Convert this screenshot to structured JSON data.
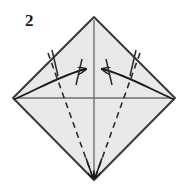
{
  "figure": {
    "type": "origami-diagram",
    "step_label": "2",
    "colors": {
      "paper_fill": "#e9e9e9",
      "paper_outline": "#3a3a3a",
      "crease_line": "#6e6e6e",
      "fold_dashed": "#2b2b2b",
      "arrow": "#1a1a1a",
      "background": "#ffffff",
      "label_text": "#1a1a1a"
    },
    "shape": {
      "name": "diamond",
      "vertices": {
        "top": [
          94,
          17
        ],
        "right": [
          175,
          98
        ],
        "bottom": [
          94,
          180
        ],
        "left": [
          13,
          98
        ]
      }
    },
    "creases": {
      "vertical": {
        "from": [
          94,
          20
        ],
        "to": [
          94,
          178
        ],
        "style": "solid"
      },
      "horizontal": {
        "from": [
          16,
          98
        ],
        "to": [
          172,
          98
        ],
        "style": "solid"
      }
    },
    "fold_lines": [
      {
        "name": "left-valley-fold",
        "from": [
          48,
          53
        ],
        "to": [
          94,
          179
        ],
        "style": "dashed"
      },
      {
        "name": "right-valley-fold",
        "from": [
          140,
          53
        ],
        "to": [
          94,
          179
        ],
        "style": "dashed"
      }
    ],
    "arrows": [
      {
        "name": "left-fold-arrow",
        "from": [
          16,
          100
        ],
        "to": [
          92,
          70
        ],
        "direction": "right",
        "style": "curved"
      },
      {
        "name": "right-fold-arrow",
        "from": [
          172,
          100
        ],
        "to": [
          96,
          70
        ],
        "direction": "left",
        "style": "curved"
      }
    ],
    "tick_marks": [
      {
        "name": "left-outer-tick"
      },
      {
        "name": "left-inner-tick"
      },
      {
        "name": "right-outer-tick"
      },
      {
        "name": "right-inner-tick"
      }
    ],
    "bottom_arrowheads": [
      {
        "name": "bottom-left-arrowhead"
      },
      {
        "name": "bottom-right-arrowhead"
      }
    ]
  }
}
